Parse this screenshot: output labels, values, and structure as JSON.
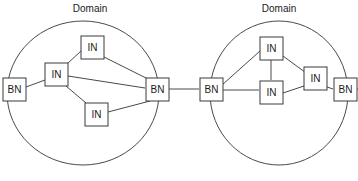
{
  "diagram": {
    "type": "network-topology",
    "canvas": {
      "width": 358,
      "height": 181
    },
    "colors": {
      "background": "#ffffff",
      "stroke": "#4a4a4a",
      "node_stroke": "#3a3a3a",
      "node_fill": "#ffffff",
      "text": "#1a1a1a"
    },
    "domains": [
      {
        "id": "domain-left",
        "label": "Domain",
        "label_x": 90,
        "label_y": 9,
        "circle": {
          "cx": 83,
          "cy": 93,
          "rx": 76,
          "ry": 72
        },
        "nodes": [
          {
            "id": "bn-left-west",
            "label": "BN",
            "x": 14,
            "y": 89,
            "w": 23,
            "h": 23,
            "role": "border-node"
          },
          {
            "id": "in-left-west",
            "label": "IN",
            "x": 56,
            "y": 74,
            "w": 23,
            "h": 23,
            "role": "interior-node"
          },
          {
            "id": "in-left-north",
            "label": "IN",
            "x": 92,
            "y": 47,
            "w": 23,
            "h": 23,
            "role": "interior-node"
          },
          {
            "id": "in-left-south",
            "label": "IN",
            "x": 96,
            "y": 114,
            "w": 23,
            "h": 23,
            "role": "interior-node"
          },
          {
            "id": "bn-left-east",
            "label": "BN",
            "x": 157,
            "y": 89,
            "w": 23,
            "h": 23,
            "role": "border-node"
          }
        ],
        "links": [
          {
            "from": "bn-left-west",
            "to": "in-left-west"
          },
          {
            "from": "in-left-west",
            "to": "in-left-north"
          },
          {
            "from": "in-left-west",
            "to": "in-left-south"
          },
          {
            "from": "in-left-west",
            "to": "bn-left-east"
          },
          {
            "from": "in-left-north",
            "to": "bn-left-east"
          },
          {
            "from": "in-left-south",
            "to": "bn-left-east"
          }
        ]
      },
      {
        "id": "domain-right",
        "label": "Domain",
        "label_x": 279,
        "label_y": 9,
        "circle": {
          "cx": 279,
          "cy": 93,
          "rx": 69,
          "ry": 72
        },
        "nodes": [
          {
            "id": "bn-right-west",
            "label": "BN",
            "x": 211,
            "y": 89,
            "w": 23,
            "h": 23,
            "role": "border-node"
          },
          {
            "id": "in-right-north",
            "label": "IN",
            "x": 271,
            "y": 48,
            "w": 23,
            "h": 23,
            "role": "interior-node"
          },
          {
            "id": "in-right-mid",
            "label": "IN",
            "x": 271,
            "y": 92,
            "w": 23,
            "h": 23,
            "role": "interior-node"
          },
          {
            "id": "in-right-east",
            "label": "IN",
            "x": 315,
            "y": 78,
            "w": 23,
            "h": 23,
            "role": "interior-node"
          },
          {
            "id": "bn-right-east",
            "label": "BN",
            "x": 345,
            "y": 89,
            "w": 23,
            "h": 23,
            "role": "border-node"
          }
        ],
        "links": [
          {
            "from": "bn-right-west",
            "to": "in-right-north"
          },
          {
            "from": "bn-right-west",
            "to": "in-right-mid"
          },
          {
            "from": "in-right-north",
            "to": "in-right-mid"
          },
          {
            "from": "in-right-north",
            "to": "in-right-east"
          },
          {
            "from": "in-right-mid",
            "to": "in-right-east"
          },
          {
            "from": "in-right-east",
            "to": "bn-right-east"
          }
        ]
      }
    ],
    "inter_domain_links": [
      {
        "id": "link-bn-left-east-to-bn-right-west",
        "x1": 169,
        "y1": 89,
        "x2": 199,
        "y2": 89
      }
    ],
    "external_stubs": [
      {
        "id": "stub-right-edge",
        "x1": 357,
        "y1": 89,
        "x2": 358,
        "y2": 89
      }
    ]
  }
}
